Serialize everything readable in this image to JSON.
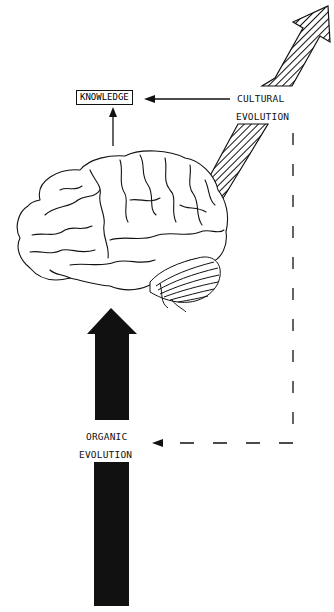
{
  "diagram": {
    "nodes": {
      "knowledge": {
        "label": "KNOWLEDGE"
      },
      "cultural": {
        "line1": "CULTURAL",
        "line2": "EVOLUTION"
      },
      "organic": {
        "line1": "ORGANIC",
        "line2": "EVOLUTION"
      },
      "brain": {
        "label": "human brain illustration"
      }
    },
    "edges": [
      {
        "from": "cultural",
        "to": "knowledge",
        "style": "solid"
      },
      {
        "from": "brain",
        "to": "knowledge",
        "style": "solid"
      },
      {
        "from": "cultural",
        "to": "organic",
        "style": "dashed"
      },
      {
        "from": "organic",
        "to": "brain",
        "style": "black-thick-arrow"
      },
      {
        "from": "brain",
        "to": "upper-right",
        "style": "hatched-arrow"
      }
    ],
    "colors": {
      "ink": "#111111",
      "background": "#ffffff"
    }
  }
}
